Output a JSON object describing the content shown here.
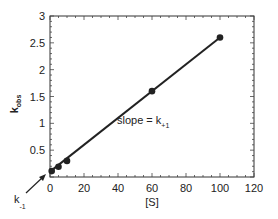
{
  "chart_data": {
    "type": "line",
    "title": "",
    "xlabel": "[S]",
    "ylabel": "k_obs",
    "ylabel_main": "k",
    "ylabel_sub": "obs",
    "xlim": [
      0,
      120
    ],
    "ylim": [
      0,
      3
    ],
    "xticks": [
      0,
      20,
      40,
      60,
      80,
      100,
      120
    ],
    "yticks": [
      0.5,
      1,
      1.5,
      2,
      2.5,
      3
    ],
    "ytick_labels": [
      "0.5",
      "1",
      "1.5",
      "2",
      "2.5",
      "3"
    ],
    "grid": false,
    "series": [
      {
        "name": "k_obs",
        "x": [
          1,
          5,
          10,
          60,
          100
        ],
        "y": [
          0.11,
          0.19,
          0.3,
          1.6,
          2.6
        ],
        "marker": "circle",
        "color": "#222222"
      }
    ],
    "fit_line": {
      "intercept": 0.1,
      "slope": 0.025,
      "x_range": [
        0,
        100
      ]
    },
    "annotations": [
      {
        "text_main": "slope = k",
        "text_sub": "+1",
        "x": 68,
        "y": 0.9
      },
      {
        "text_main": "k",
        "text_sub": "-1",
        "label": "k_-1",
        "points_to": [
          0,
          0.1
        ]
      }
    ]
  }
}
